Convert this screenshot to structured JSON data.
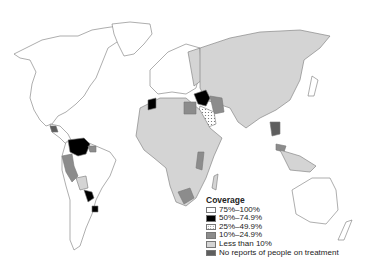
{
  "legend": {
    "title": "Coverage",
    "items": [
      {
        "label": "75%–100%",
        "color": "#ffffff",
        "pattern": "solid"
      },
      {
        "label": "50%–74.9%",
        "color": "#000000",
        "pattern": "solid"
      },
      {
        "label": "25%–49.9%",
        "color": "#ffffff",
        "pattern": "dotted"
      },
      {
        "label": "10%–24.9%",
        "color": "#8c8c8c",
        "pattern": "solid"
      },
      {
        "label": "Less than 10%",
        "color": "#d4d4d4",
        "pattern": "solid"
      },
      {
        "label": "No reports of people on treatment",
        "color": "#5e5e5e",
        "pattern": "solid"
      }
    ]
  },
  "colors": {
    "outline": "#777777",
    "background": "#ffffff"
  }
}
